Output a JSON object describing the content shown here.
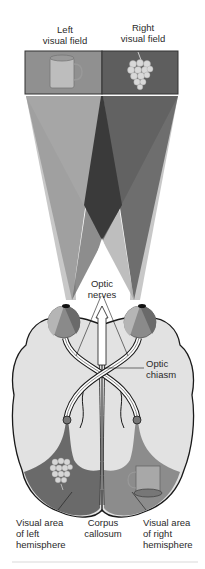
{
  "figure": {
    "labels": {
      "left_field": "Left visual field",
      "left_field_l1": "Left",
      "left_field_l2": "visual field",
      "right_field_l1": "Right",
      "right_field_l2": "visual field",
      "optic_nerves_l1": "Optic",
      "optic_nerves_l2": "nerves",
      "optic_chiasm_l1": "Optic",
      "optic_chiasm_l2": "chiasm",
      "left_visual_area_l1": "Visual area",
      "left_visual_area_l2": "of left",
      "left_visual_area_l3": "hemisphere",
      "corpus_l1": "Corpus",
      "corpus_l2": "callosum",
      "right_visual_area_l1": "Visual area",
      "right_visual_area_l2": "of right",
      "right_visual_area_l3": "hemisphere"
    },
    "objects": {
      "left_field_object": "mug-icon",
      "right_field_object": "grapes-icon",
      "left_hemisphere_object": "grapes-icon",
      "right_hemisphere_object": "mug-icon"
    },
    "colors": {
      "left_field_box": "#8e8e8e",
      "right_field_box": "#5e5e5e",
      "cone_light": "#c4c4c4",
      "cone_mid": "#9a9a9a",
      "cone_dark": "#6a6a6a",
      "cone_overlap": "#3c3c3c",
      "brain_fill": "#e2e2e2",
      "left_visual_area": "#6a6a6a",
      "right_visual_area": "#8c8c8c",
      "outline": "#1a1a1a"
    }
  }
}
